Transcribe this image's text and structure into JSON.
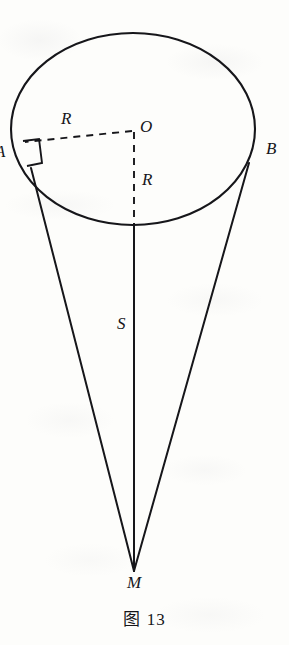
{
  "figure": {
    "caption": "图 13",
    "caption_number": "13",
    "type": "geometry-diagram",
    "ink_color": "#16161a",
    "paper_color": "#fdfdfb",
    "labels": {
      "vertex_a": "A",
      "vertex_b": "B",
      "center_o": "O",
      "radius_horizontal": "R",
      "radius_vertical": "R",
      "slant_height": "S",
      "apex_m": "M"
    },
    "annotations": {
      "right_angle_marker": "right-angle"
    },
    "geometry": {
      "base_ellipse": {
        "cx": 133,
        "cy": 129,
        "rx": 122,
        "ry": 96
      },
      "apex": {
        "x": 134,
        "y": 571
      },
      "point_a": {
        "x": 20,
        "y": 152
      },
      "point_b": {
        "x": 255,
        "y": 148
      },
      "center": {
        "x": 133,
        "y": 129
      }
    }
  }
}
